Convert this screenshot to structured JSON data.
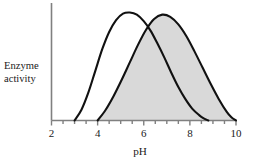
{
  "figure": {
    "background_color": "#ffffff",
    "axis_color": "#808080",
    "curve_color": "#111111",
    "fill_color": "#d9d9d9",
    "y_axis_label_line1": "Enzyme",
    "y_axis_label_line2": "activity",
    "x_axis_label": "pH"
  },
  "chart_data": {
    "type": "line",
    "title": "",
    "xlabel": "pH",
    "ylabel": "Enzyme activity",
    "xlim": [
      2,
      10
    ],
    "ylim": [
      0,
      1.05
    ],
    "grid": false,
    "legend": "none",
    "x_ticks": [
      2,
      4,
      6,
      8,
      10
    ],
    "x_tick_labels": [
      "2",
      "4",
      "6",
      "8",
      "10"
    ],
    "x_minor_tick_step": 0.5,
    "y_ticks": [],
    "y_tick_labels": [],
    "annotations": [],
    "series": [
      {
        "name": "enzyme-1",
        "filled": false,
        "peak_x": 5.4,
        "peak_y": 1.0,
        "start_x": 3.0,
        "end_x": 8.8,
        "x": [
          3.0,
          3.3,
          3.6,
          3.9,
          4.2,
          4.5,
          4.8,
          5.1,
          5.4,
          5.7,
          6.0,
          6.3,
          6.6,
          6.9,
          7.2,
          7.5,
          7.8,
          8.1,
          8.4,
          8.6,
          8.8
        ],
        "y": [
          0.0,
          0.1,
          0.26,
          0.46,
          0.66,
          0.82,
          0.93,
          0.99,
          1.0,
          0.98,
          0.92,
          0.83,
          0.71,
          0.58,
          0.44,
          0.31,
          0.2,
          0.11,
          0.05,
          0.02,
          0.0
        ]
      },
      {
        "name": "enzyme-2",
        "filled": true,
        "peak_x": 6.8,
        "peak_y": 0.98,
        "start_x": 4.0,
        "end_x": 10.0,
        "x": [
          4.0,
          4.35,
          4.7,
          5.05,
          5.4,
          5.75,
          6.1,
          6.45,
          6.8,
          7.15,
          7.5,
          7.85,
          8.2,
          8.55,
          8.9,
          9.25,
          9.6,
          9.8,
          10.0
        ],
        "y": [
          0.0,
          0.1,
          0.23,
          0.38,
          0.54,
          0.7,
          0.84,
          0.94,
          0.98,
          0.96,
          0.89,
          0.78,
          0.64,
          0.49,
          0.34,
          0.2,
          0.08,
          0.03,
          0.0
        ]
      }
    ]
  }
}
